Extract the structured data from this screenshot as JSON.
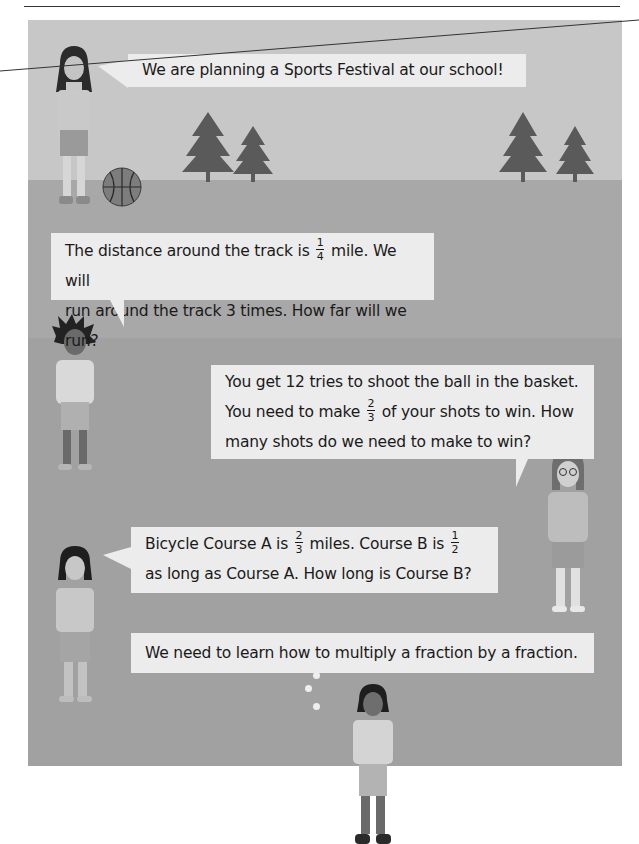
{
  "bubbles": [
    {
      "speaker": "girl-with-long-hair",
      "text": "We are planning a Sports Festival at our school!"
    },
    {
      "speaker": "boy-with-spiky-hair",
      "line1_pre": "The distance around the track is",
      "fraction1": {
        "num": "1",
        "den": "4"
      },
      "line1_post": "mile. We will",
      "line2": "run around the track 3 times. How far will we run?"
    },
    {
      "speaker": "girl-with-glasses",
      "line1": "You get 12 tries to shoot the ball in the basket.",
      "line2_pre": "You need to make",
      "fraction1": {
        "num": "2",
        "den": "3"
      },
      "line2_post": "of your shots to win. How",
      "line3": "many shots do we need to make to win?"
    },
    {
      "speaker": "girl-with-short-hair",
      "line1_pre": "Bicycle Course A is",
      "fraction1": {
        "num": "2",
        "den": "3"
      },
      "line1_mid": "miles. Course B is",
      "fraction2": {
        "num": "1",
        "den": "2"
      },
      "line2": "as long as Course A. How long is Course B?"
    },
    {
      "speaker": "thinking-boy",
      "text": "We need to learn how to multiply a fraction by a fraction."
    }
  ],
  "scene": {
    "colors": {
      "sky": "#c7c7c7",
      "ground": "#a8a8a8",
      "track": "#a1a1a1",
      "bubble": "#ececec",
      "tree": "#5a5a5a",
      "text": "#1a1a1a"
    },
    "objects": [
      "pine-tree",
      "pine-tree",
      "pine-tree",
      "pine-tree",
      "basketball"
    ]
  }
}
